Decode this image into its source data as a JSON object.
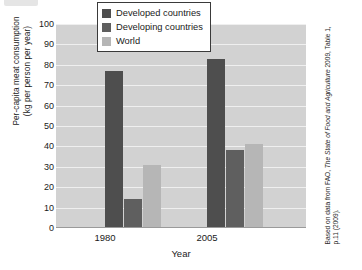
{
  "chart_data": {
    "type": "bar",
    "title": "",
    "categories": [
      "1980",
      "2005"
    ],
    "series": [
      {
        "name": "Developed countries",
        "values": [
          77,
          83
        ],
        "color": "#4e4e4e"
      },
      {
        "name": "Developing countries",
        "values": [
          14,
          38
        ],
        "color": "#5f5f5f"
      },
      {
        "name": "World",
        "values": [
          31,
          41
        ],
        "color": "#b6b6b6"
      }
    ],
    "xlabel": "Year",
    "ylabel": "Per-capita meat consumption (kg per person per year)",
    "ylabel_line1": "Per-capita meat consumption",
    "ylabel_line2": "(kg per person per year)",
    "ylim": [
      0,
      100
    ],
    "ytick_step": 10,
    "yticks": [
      "100",
      "90",
      "80",
      "70",
      "60",
      "50",
      "40",
      "30",
      "20",
      "10",
      "0"
    ],
    "grid": true,
    "grid_axis": "y",
    "legend_position": "top-center",
    "plot_background": "#d2d2d2",
    "gridline_color": "#efefef"
  },
  "legend": {
    "items": [
      {
        "label": "Developed countries",
        "swatch": "#4e4e4e"
      },
      {
        "label": "Developing countries",
        "swatch": "#5f5f5f"
      },
      {
        "label": "World",
        "swatch": "#b6b6b6"
      }
    ]
  },
  "axes": {
    "x_title": "Year",
    "x_categories": [
      "1980",
      "2005"
    ],
    "y_title_line1": "Per-capita meat consumption",
    "y_title_line2": "(kg per person per year)",
    "y_ticks": [
      "100",
      "90",
      "80",
      "70",
      "60",
      "50",
      "40",
      "30",
      "20",
      "10",
      "0"
    ]
  },
  "credit": {
    "prefix": "Based on data from FAO, ",
    "italic": "The State of Food and Agriculture",
    "suffix": " 2009, Table 1, p.11 (2009)."
  }
}
